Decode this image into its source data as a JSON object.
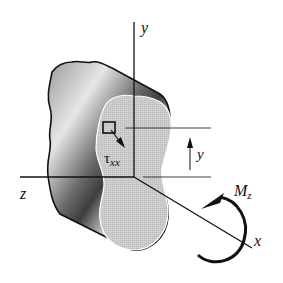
{
  "figure": {
    "axes": {
      "y_label": "y",
      "z_label": "z",
      "x_label": "x"
    },
    "stress_label": {
      "symbol": "τ",
      "subscript": "xx"
    },
    "dimension_label": "y",
    "moment_label": {
      "symbol": "M",
      "subscript": "z"
    },
    "colors": {
      "ink": "#111111",
      "face_fill": "#c8c8c8",
      "body_dark": "#5a5a5a",
      "body_light": "#e8e8e8",
      "background": "#ffffff"
    }
  }
}
